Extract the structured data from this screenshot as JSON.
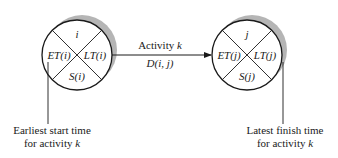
{
  "diagram": {
    "node_i": {
      "top": "i",
      "left": "ET(i)",
      "right": "LT(i)",
      "bottom": "S(i)"
    },
    "node_j": {
      "top": "j",
      "left": "ET(j)",
      "right": "LT(j)",
      "bottom": "S(j)"
    },
    "edge": {
      "label_top_prefix": "Activity ",
      "label_top_var": "k",
      "label_bottom": "D(i, j)"
    },
    "annotations": {
      "left_line1": "Earliest start time",
      "left_line2_prefix": "for activity ",
      "left_line2_var": "k",
      "right_line1": "Latest finish time",
      "right_line2_prefix": "for activity ",
      "right_line2_var": "k"
    },
    "colors": {
      "stroke": "#1a1a1a",
      "shadow": "#b5b5b5"
    }
  }
}
